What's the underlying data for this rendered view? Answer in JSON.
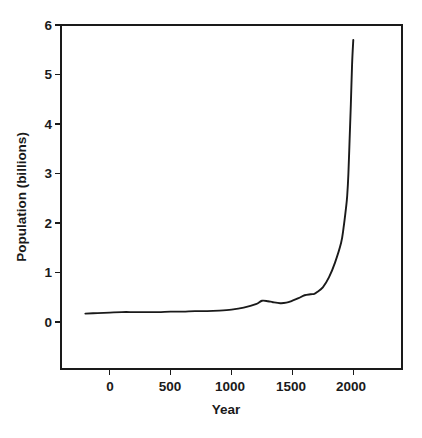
{
  "chart_data": {
    "type": "line",
    "title": "",
    "subtitle": "",
    "xlabel": "Year",
    "ylabel": "Population (billions)",
    "xlim": [
      -400,
      2400
    ],
    "ylim": [
      0,
      6
    ],
    "xticks": [
      0,
      500,
      1000,
      1500,
      2000
    ],
    "xtick_labels": [
      "0",
      "500",
      "1000",
      "1500",
      "2000"
    ],
    "yticks": [
      0,
      1,
      2,
      3,
      4,
      5,
      6
    ],
    "ytick_labels": [
      "0",
      "1",
      "2",
      "3",
      "4",
      "5",
      "6"
    ],
    "grid": false,
    "legend": null,
    "legend_position": "none",
    "line_color": "#1a1a1a",
    "background_color": "#ffffff",
    "axis_color": "#1a1a1a",
    "series": [
      {
        "name": "World population",
        "x": [
          -200,
          -100,
          0,
          100,
          200,
          300,
          400,
          500,
          600,
          700,
          800,
          900,
          1000,
          1100,
          1200,
          1250,
          1300,
          1340,
          1400,
          1450,
          1500,
          1550,
          1600,
          1650,
          1680,
          1700,
          1750,
          1800,
          1850,
          1900,
          1920,
          1940,
          1950,
          1960,
          1970,
          1980,
          1990,
          2000
        ],
        "y": [
          0.17,
          0.18,
          0.19,
          0.2,
          0.2,
          0.2,
          0.2,
          0.21,
          0.21,
          0.22,
          0.22,
          0.23,
          0.25,
          0.29,
          0.36,
          0.43,
          0.42,
          0.4,
          0.38,
          0.39,
          0.43,
          0.48,
          0.54,
          0.56,
          0.57,
          0.6,
          0.7,
          0.9,
          1.2,
          1.6,
          1.9,
          2.3,
          2.55,
          3.0,
          3.7,
          4.4,
          5.2,
          5.7
        ]
      }
    ],
    "annotations": []
  },
  "axes": {
    "y_title": "Population (billions)",
    "x_title": "Year",
    "y_tick_0": "0",
    "y_tick_1": "1",
    "y_tick_2": "2",
    "y_tick_3": "3",
    "y_tick_4": "4",
    "y_tick_5": "5",
    "y_tick_6": "6",
    "x_tick_0": "0",
    "x_tick_1": "500",
    "x_tick_2": "1000",
    "x_tick_3": "1500",
    "x_tick_4": "2000"
  }
}
